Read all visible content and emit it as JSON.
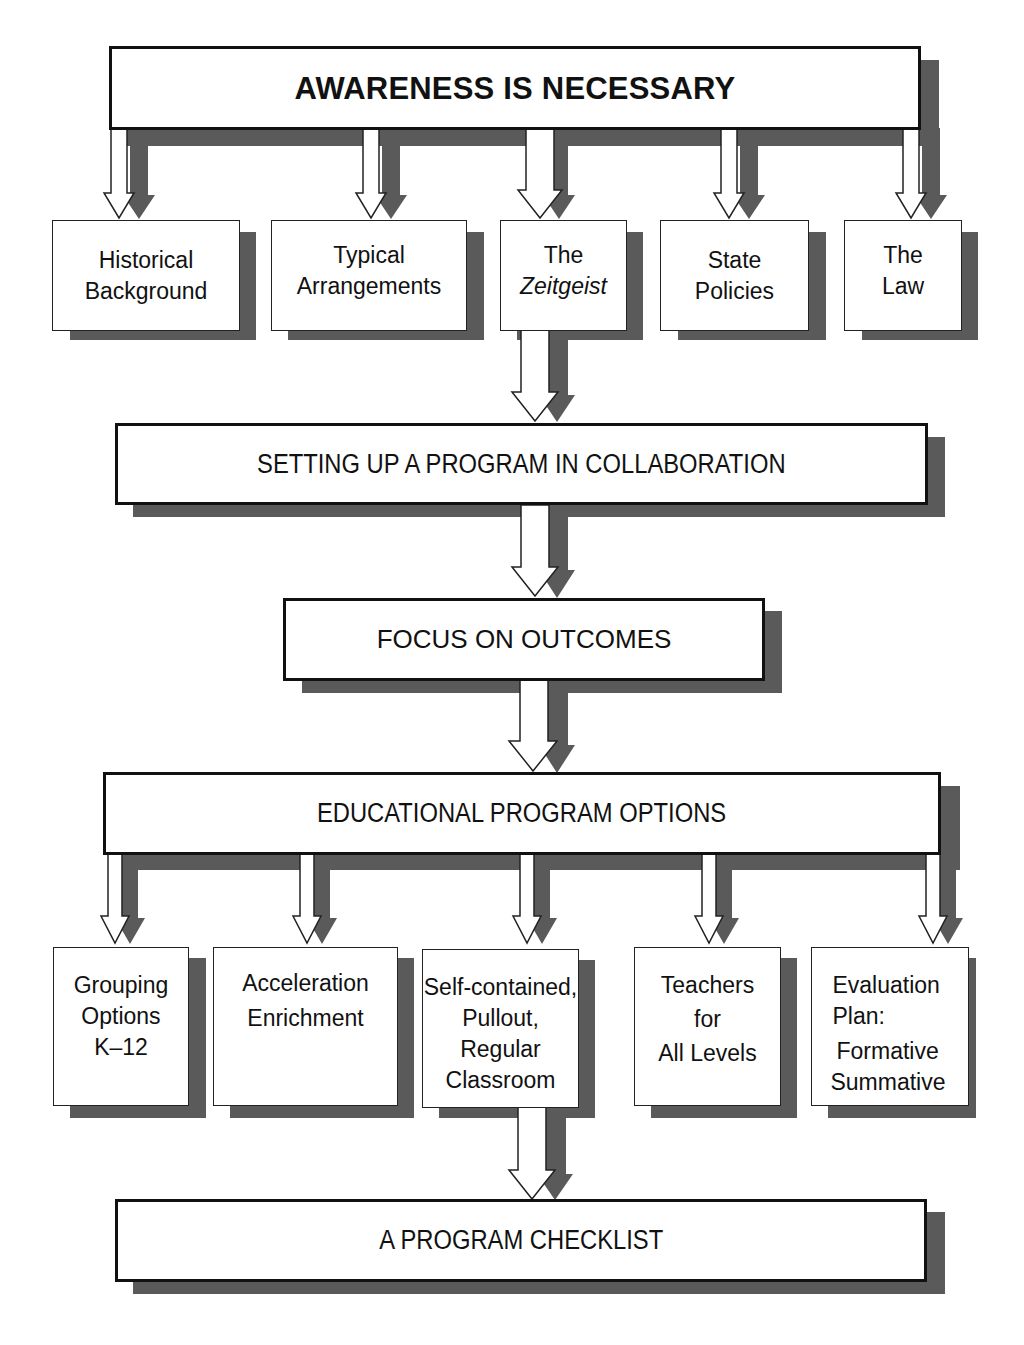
{
  "diagram": {
    "colors": {
      "box_fill": "#ffffff",
      "box_border": "#111111",
      "shadow": "#5a5a5a",
      "arrow_fill": "#ffffff",
      "text": "#111111"
    },
    "top": {
      "title": "AWARENESS IS NECESSARY"
    },
    "awareness_items": [
      {
        "line1": "Historical",
        "line2": "Background"
      },
      {
        "line1": "Typical",
        "line2": "Arrangements"
      },
      {
        "line1": "The",
        "line2": "Zeitgeist"
      },
      {
        "line1": "State",
        "line2": "Policies"
      },
      {
        "line1": "The",
        "line2": "Law"
      }
    ],
    "setup": {
      "title": "SETTING UP A PROGRAM IN COLLABORATION"
    },
    "focus": {
      "title": "FOCUS ON OUTCOMES"
    },
    "options": {
      "title": "EDUCATIONAL PROGRAM OPTIONS"
    },
    "option_items": [
      {
        "lines": [
          "Grouping",
          "Options",
          "K–12"
        ]
      },
      {
        "lines": [
          "Acceleration",
          "Enrichment"
        ]
      },
      {
        "lines": [
          "Self-contained,",
          "Pullout,",
          "Regular",
          "Classroom"
        ]
      },
      {
        "lines": [
          "Teachers",
          "for",
          "All Levels"
        ]
      },
      {
        "lines": [
          "Evaluation",
          "Plan:",
          "Formative",
          "Summative"
        ]
      }
    ],
    "checklist": {
      "title": "A PROGRAM CHECKLIST"
    },
    "flow": [
      "AWARENESS IS NECESSARY",
      "SETTING UP A PROGRAM IN COLLABORATION",
      "FOCUS ON OUTCOMES",
      "EDUCATIONAL PROGRAM OPTIONS",
      "A PROGRAM CHECKLIST"
    ]
  }
}
